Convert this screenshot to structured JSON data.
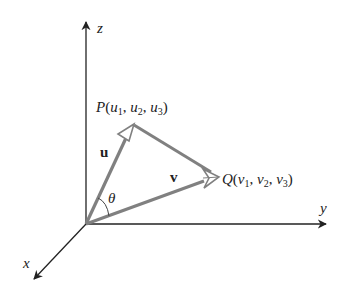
{
  "diagram": {
    "axes": {
      "z": {
        "label": "z"
      },
      "y": {
        "label": "y"
      },
      "x": {
        "label": "x"
      }
    },
    "points": {
      "P": {
        "name": "P",
        "open": "(",
        "c1": "u",
        "s1": "1",
        "c2": "u",
        "s2": "2",
        "c3": "u",
        "s3": "3",
        "close": ")"
      },
      "Q": {
        "name": "Q",
        "open": "(",
        "c1": "v",
        "s1": "1",
        "c2": "v",
        "s2": "2",
        "c3": "v",
        "s3": "3",
        "close": ")"
      }
    },
    "vectors": {
      "u": {
        "label": "u"
      },
      "v": {
        "label": "v"
      }
    },
    "angle": {
      "label": "θ"
    },
    "separator": ", ",
    "colors": {
      "axis": "#222222",
      "vector": "#808080",
      "arrowhead_fill": "#ffffff",
      "text": "#222222"
    }
  }
}
